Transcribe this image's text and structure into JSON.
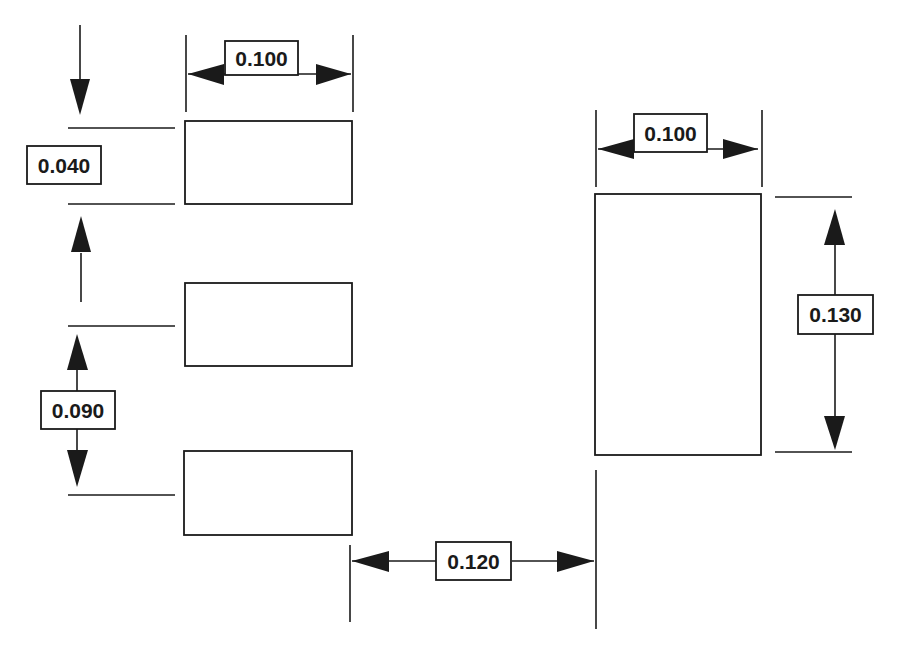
{
  "diagram": {
    "type": "pad-layout-dimension-drawing",
    "left_pads": [
      {
        "id": "pad-1"
      },
      {
        "id": "pad-2"
      },
      {
        "id": "pad-3"
      }
    ],
    "right_pad": {
      "id": "pad-large"
    },
    "dimensions": {
      "left_pad_width": "0.100",
      "left_pad_height": "0.040",
      "left_pad_pitch": "0.090",
      "right_pad_width": "0.100",
      "right_pad_height": "0.130",
      "pad_gap": "0.120"
    },
    "colors": {
      "ink": "#1a1a1a",
      "background": "#ffffff"
    }
  }
}
